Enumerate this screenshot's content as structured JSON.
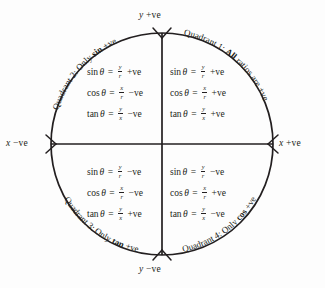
{
  "diagram": {
    "circle": {
      "cx": 162,
      "cy": 144,
      "r": 111
    },
    "stroke_color": "#231f20",
    "background_color": "#fdfdfd"
  },
  "axes": {
    "y_positive_label": "y +ve",
    "y_negative_label": "y −ve",
    "x_negative_label": "x −ve",
    "x_positive_label": "x +ve",
    "y_positive_var": "y",
    "y_positive_sign": "+ve",
    "y_negative_var": "y",
    "y_negative_sign": "−ve",
    "x_negative_var": "x",
    "x_negative_sign": "−ve",
    "x_positive_var": "x",
    "x_positive_sign": "+ve"
  },
  "quadrants": [
    {
      "id": "q1",
      "caption_prefix": "Quadrant 1: ",
      "caption_strong": "All",
      "caption_suffix": " ratios are +ve",
      "caption_full": "Quadrant 1: All ratios are +ve",
      "formulas": [
        {
          "fn": "sin",
          "theta": "θ",
          "eq": "=",
          "num": "y",
          "den": "r",
          "sign": "+ve"
        },
        {
          "fn": "cos",
          "theta": "θ",
          "eq": "=",
          "num": "x",
          "den": "r",
          "sign": "+ve"
        },
        {
          "fn": "tan",
          "theta": "θ",
          "eq": "=",
          "num": "y",
          "den": "x",
          "sign": "+ve"
        }
      ]
    },
    {
      "id": "q2",
      "caption_prefix": "Quadrant 2: Only ",
      "caption_strong": "sin",
      "caption_suffix": " +ve",
      "caption_full": "Quadrant 2: Only sin +ve",
      "formulas": [
        {
          "fn": "sin",
          "theta": "θ",
          "eq": "=",
          "num": "y",
          "den": "r",
          "sign": "+ve"
        },
        {
          "fn": "cos",
          "theta": "θ",
          "eq": "=",
          "num": "x",
          "den": "r",
          "sign": "−ve"
        },
        {
          "fn": "tan",
          "theta": "θ",
          "eq": "=",
          "num": "y",
          "den": "x",
          "sign": "−ve"
        }
      ]
    },
    {
      "id": "q3",
      "caption_prefix": "Quadrant 3: Only ",
      "caption_strong": "tan",
      "caption_suffix": " +ve",
      "caption_full": "Quadrant 3: Only tan +ve",
      "formulas": [
        {
          "fn": "sin",
          "theta": "θ",
          "eq": "=",
          "num": "y",
          "den": "r",
          "sign": "−ve"
        },
        {
          "fn": "cos",
          "theta": "θ",
          "eq": "=",
          "num": "x",
          "den": "r",
          "sign": "−ve"
        },
        {
          "fn": "tan",
          "theta": "θ",
          "eq": "=",
          "num": "y",
          "den": "x",
          "sign": "+ve"
        }
      ]
    },
    {
      "id": "q4",
      "caption_prefix": "Quadrant 4: Only ",
      "caption_strong": "cos",
      "caption_suffix": " +ve",
      "caption_full": "Quadrant 4: Only cos +ve",
      "formulas": [
        {
          "fn": "sin",
          "theta": "θ",
          "eq": "=",
          "num": "y",
          "den": "r",
          "sign": "−ve"
        },
        {
          "fn": "cos",
          "theta": "θ",
          "eq": "=",
          "num": "x",
          "den": "r",
          "sign": "+ve"
        },
        {
          "fn": "tan",
          "theta": "θ",
          "eq": "=",
          "num": "y",
          "den": "x",
          "sign": "−ve"
        }
      ]
    }
  ]
}
